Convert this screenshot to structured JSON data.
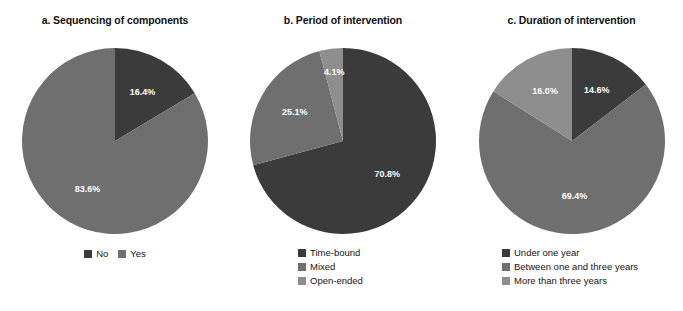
{
  "figure": {
    "background": "#ffffff",
    "label_color": "#ffffff",
    "title_color": "#101010"
  },
  "palette": {
    "dark": "#3b3b3b",
    "medium": "#6f6f6f",
    "light": "#8e8e8e"
  },
  "panels": [
    {
      "id": "a",
      "title": "a. Sequencing of components",
      "legend_layout": "horizontal",
      "chart_data": {
        "type": "pie",
        "title": "a. Sequencing of components",
        "categories": [
          "No",
          "Yes"
        ],
        "values": [
          16.4,
          83.6
        ],
        "labels": [
          "16.4%",
          "83.6%"
        ],
        "colors": [
          "#3b3b3b",
          "#6f6f6f"
        ],
        "legend": [
          "No",
          "Yes"
        ],
        "legend_position": "bottom",
        "start_angle": 0,
        "grid": false
      }
    },
    {
      "id": "b",
      "title": "b. Period of intervention",
      "legend_layout": "vertical",
      "chart_data": {
        "type": "pie",
        "title": "b. Period of intervention",
        "categories": [
          "Time-bound",
          "Mixed",
          "Open-ended"
        ],
        "values": [
          70.8,
          25.1,
          4.1
        ],
        "labels": [
          "70.8%",
          "25.1%",
          "4.1%"
        ],
        "colors": [
          "#3b3b3b",
          "#6f6f6f",
          "#8e8e8e"
        ],
        "legend": [
          "Time-bound",
          "Mixed",
          "Open-ended"
        ],
        "legend_position": "bottom",
        "start_angle": 0,
        "grid": false
      }
    },
    {
      "id": "c",
      "title": "c. Duration of intervention",
      "legend_layout": "vertical",
      "chart_data": {
        "type": "pie",
        "title": "c. Duration of intervention",
        "categories": [
          "Under one year",
          "Between one and three years",
          "More than three years"
        ],
        "values": [
          14.6,
          69.4,
          16.0
        ],
        "labels": [
          "14.6%",
          "69.4%",
          "16.0%"
        ],
        "colors": [
          "#3b3b3b",
          "#6f6f6f",
          "#8e8e8e"
        ],
        "legend": [
          "Under one year",
          "Between one and three years",
          "More than three years"
        ],
        "legend_position": "bottom",
        "start_angle": 0,
        "grid": false
      }
    }
  ]
}
